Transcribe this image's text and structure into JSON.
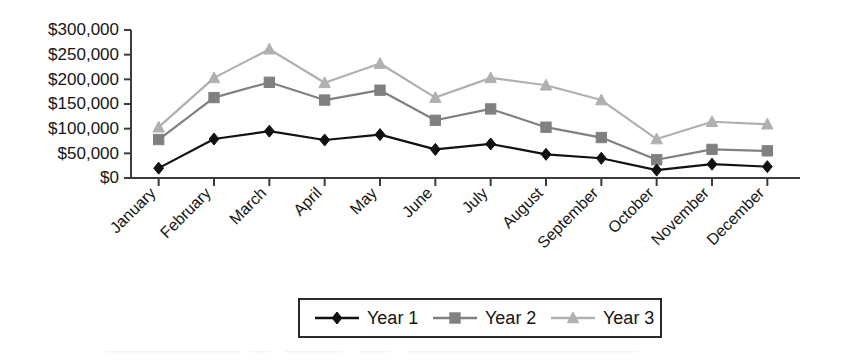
{
  "chart_data": {
    "type": "line",
    "title": "",
    "xlabel": "",
    "ylabel": "",
    "categories": [
      "January",
      "February",
      "March",
      "April",
      "May",
      "June",
      "July",
      "August",
      "September",
      "October",
      "November",
      "December"
    ],
    "series": [
      {
        "name": "Year  1",
        "marker": "diamond",
        "color": "#111111",
        "values": [
          20000,
          79000,
          95000,
          77000,
          88000,
          58000,
          69000,
          48000,
          40000,
          16000,
          28000,
          23000
        ]
      },
      {
        "name": "Year  2",
        "marker": "square",
        "color": "#808080",
        "values": [
          78000,
          163000,
          194000,
          158000,
          178000,
          117000,
          140000,
          103000,
          82000,
          37000,
          58000,
          55000
        ]
      },
      {
        "name": "Year  3",
        "marker": "triangle",
        "color": "#b0b0b0",
        "values": [
          103000,
          203000,
          261000,
          193000,
          232000,
          163000,
          203000,
          188000,
          158000,
          79000,
          114000,
          109000
        ]
      }
    ],
    "ylim": [
      0,
      300000
    ],
    "ytick_values": [
      0,
      50000,
      100000,
      150000,
      200000,
      250000,
      300000
    ],
    "ytick_labels": [
      "$0",
      "$50,000",
      "$100,000",
      "$150,000",
      "$200,000",
      "$250,000",
      "$300,000"
    ],
    "grid": false,
    "legend_position": "bottom",
    "legend_entries": [
      "Year  1",
      "Year  2",
      "Year  3"
    ]
  },
  "axes": {
    "y_axis_name": "y-axis",
    "x_axis_name": "x-axis"
  }
}
